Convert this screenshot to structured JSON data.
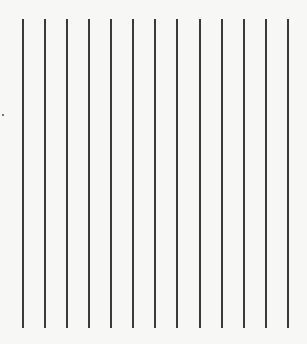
{
  "page": {
    "background": "#f7f7f5",
    "line_color": "#3a3a3a",
    "line_top": 19,
    "line_bottom": 328,
    "lines_x": [
      22,
      44,
      66,
      88,
      110,
      132,
      154,
      176,
      199,
      221,
      243,
      265,
      287
    ],
    "specks": [
      {
        "x": 2,
        "y": 114
      }
    ]
  }
}
